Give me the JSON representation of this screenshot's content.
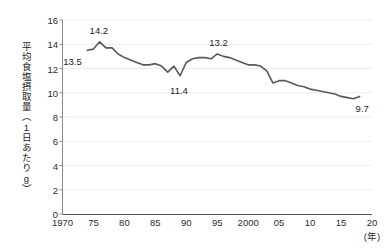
{
  "chart_data": {
    "type": "line",
    "title": "",
    "xlabel": "(年)",
    "ylabel": "平均食塩摂取量（1日あたりg）",
    "xlim": [
      1970,
      2020
    ],
    "ylim": [
      0,
      16
    ],
    "grid": true,
    "legend": "none",
    "line_color": "#595959",
    "x_ticks": [
      "1970",
      "75",
      "80",
      "85",
      "90",
      "95",
      "2000",
      "05",
      "10",
      "15",
      "20"
    ],
    "x_tick_values": [
      1970,
      1975,
      1980,
      1985,
      1990,
      1995,
      2000,
      2005,
      2010,
      2015,
      2020
    ],
    "y_ticks": [
      "0",
      "2",
      "4",
      "6",
      "8",
      "10",
      "12",
      "14",
      "16"
    ],
    "y_tick_values": [
      0,
      2,
      4,
      6,
      8,
      10,
      12,
      14,
      16
    ],
    "x": [
      1974,
      1975,
      1976,
      1977,
      1978,
      1979,
      1980,
      1981,
      1982,
      1983,
      1984,
      1985,
      1986,
      1987,
      1988,
      1989,
      1990,
      1991,
      1992,
      1993,
      1994,
      1995,
      1996,
      1997,
      1998,
      1999,
      2000,
      2001,
      2002,
      2003,
      2004,
      2005,
      2006,
      2007,
      2008,
      2009,
      2010,
      2011,
      2012,
      2013,
      2014,
      2015,
      2016,
      2017,
      2018
    ],
    "values": [
      13.5,
      13.6,
      14.2,
      13.7,
      13.7,
      13.2,
      12.9,
      12.7,
      12.5,
      12.3,
      12.3,
      12.4,
      12.2,
      11.7,
      12.2,
      11.4,
      12.5,
      12.8,
      12.9,
      12.9,
      12.8,
      13.2,
      13.0,
      12.9,
      12.7,
      12.5,
      12.3,
      12.3,
      12.2,
      11.8,
      10.8,
      11.0,
      11.0,
      10.8,
      10.6,
      10.5,
      10.3,
      10.2,
      10.1,
      10.0,
      9.9,
      9.7,
      9.6,
      9.5,
      9.7
    ],
    "annotations": [
      {
        "label": "13.5",
        "year": 1974,
        "value": 13.5
      },
      {
        "label": "14.2",
        "year": 1976,
        "value": 14.2
      },
      {
        "label": "11.4",
        "year": 1989,
        "value": 11.4
      },
      {
        "label": "13.2",
        "year": 1995,
        "value": 13.2
      },
      {
        "label": "9.7",
        "year": 2018,
        "value": 9.7
      }
    ]
  },
  "axes": {
    "y_axis_label": "平均食塩摂取量（1日あたりg）",
    "x_unit": "(年)"
  }
}
